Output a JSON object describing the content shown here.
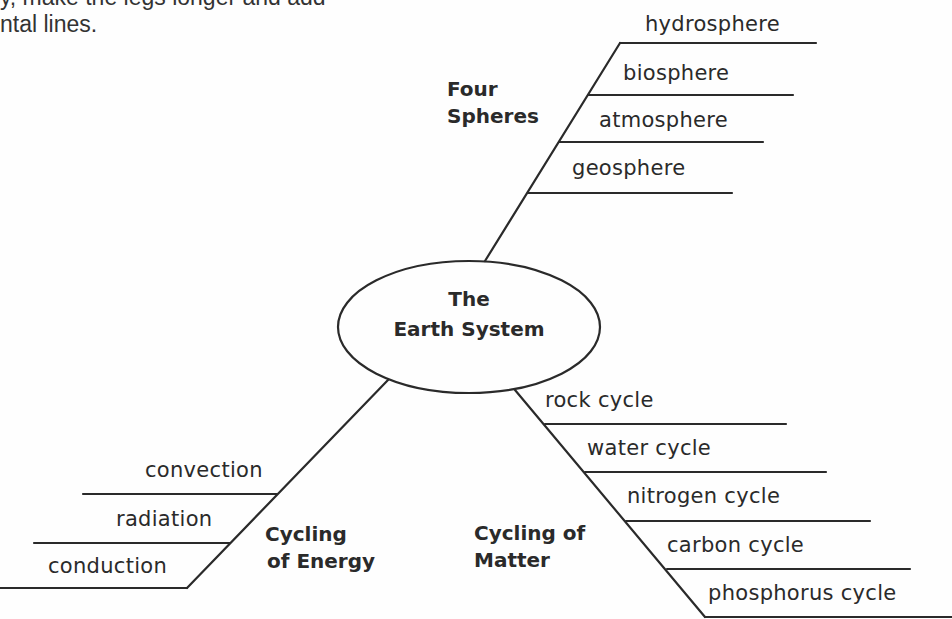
{
  "instructions": {
    "line1": "y, make the legs longer and add",
    "line2": "ntal lines."
  },
  "center": {
    "line1": "The",
    "line2": "Earth System"
  },
  "branches": {
    "four_spheres": {
      "title_line1": "Four",
      "title_line2": "Spheres",
      "items": [
        "hydrosphere",
        "biosphere",
        "atmosphere",
        "geosphere"
      ]
    },
    "cycling_of_energy": {
      "title_line1": "Cycling",
      "title_line2": "of Energy",
      "items": [
        "convection",
        "radiation",
        "conduction"
      ]
    },
    "cycling_of_matter": {
      "title_line1": "Cycling of",
      "title_line2": "Matter",
      "items": [
        "rock cycle",
        "water cycle",
        "nitrogen cycle",
        "carbon cycle",
        "phosphorus cycle"
      ]
    }
  },
  "colors": {
    "ink": "#2a2a2a",
    "background": "#fefefe"
  }
}
